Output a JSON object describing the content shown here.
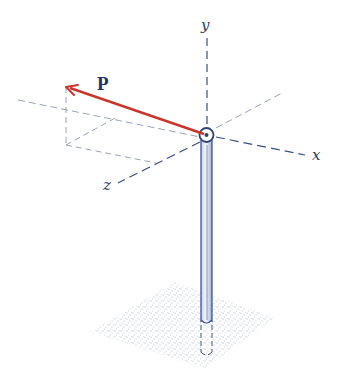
{
  "figure": {
    "vector_label": "P",
    "axes": {
      "x_label": "x",
      "y_label": "y",
      "z_label": "z"
    },
    "colors": {
      "vector": "#c8372d",
      "axis_dash": "#3a4f85",
      "construction_dash": "#9aa3b8",
      "pole": "#3f5590",
      "pole_fill": "#dde4f0",
      "ground": "#7a8aa8",
      "label": "#1f3566"
    }
  }
}
